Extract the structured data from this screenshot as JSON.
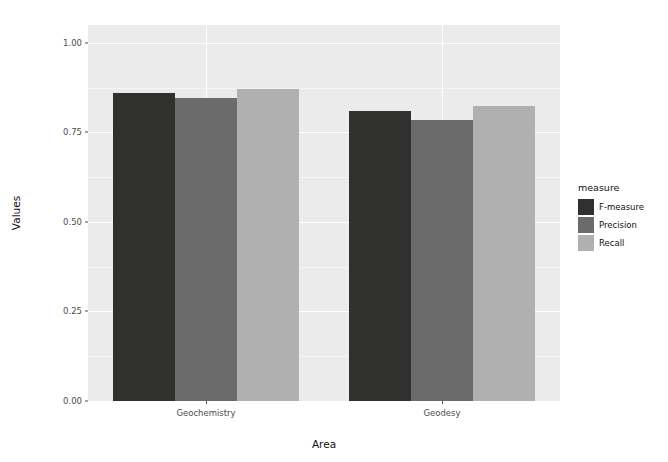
{
  "chart_data": {
    "type": "bar",
    "title": "",
    "xlabel": "Area",
    "ylabel": "Values",
    "categories": [
      "Geochemistry",
      "Geodesy"
    ],
    "series": [
      {
        "name": "F-measure",
        "values": [
          0.86,
          0.81
        ],
        "color": "#30302f"
      },
      {
        "name": "Precision",
        "values": [
          0.845,
          0.785
        ],
        "color": "#6b6b6b"
      },
      {
        "name": "Recall",
        "values": [
          0.87,
          0.825
        ],
        "color": "#b0b0b0"
      }
    ],
    "ylim": [
      0.0,
      1.05
    ],
    "y_ticks": [
      "0.00",
      "0.25",
      "0.50",
      "0.75",
      "1.00"
    ],
    "y_tick_values": [
      0.0,
      0.25,
      0.5,
      0.75,
      1.0
    ],
    "legend": {
      "title": "measure",
      "position": "right",
      "entries": [
        "F-measure",
        "Precision",
        "Recall"
      ]
    },
    "grid": true,
    "panel_background": "#ebebeb",
    "grid_color": "#ffffff"
  }
}
